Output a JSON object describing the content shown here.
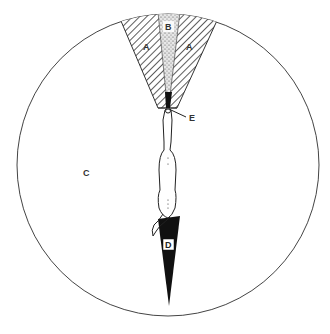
{
  "diagram": {
    "type": "zone-diagram",
    "labels": {
      "a_left": "A",
      "a_right": "A",
      "b": "B",
      "c": "C",
      "d": "D",
      "e": "E"
    },
    "regions": [
      {
        "id": "A",
        "style": "diagonal-hatched wedge",
        "position": "front, left and right of centre"
      },
      {
        "id": "B",
        "style": "stippled narrow wedge",
        "position": "front centre"
      },
      {
        "id": "C",
        "style": "open circle area",
        "position": "surrounding"
      },
      {
        "id": "D",
        "style": "solid black wedge",
        "position": "rear, behind animal"
      },
      {
        "id": "E",
        "style": "leader line",
        "position": "at the animal's head"
      }
    ],
    "colors": {
      "line": "#444444",
      "fill_dark": "#111111",
      "background": "#ffffff"
    }
  }
}
